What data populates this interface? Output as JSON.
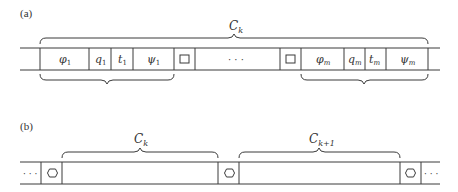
{
  "panel_a": {
    "label": "(a)",
    "top_brace_label": "C",
    "top_brace_sub": "k",
    "first_group": {
      "cells": [
        {
          "sym": "φ",
          "sub": "1"
        },
        {
          "sym": "q",
          "sub": "1"
        },
        {
          "sym": "t",
          "sub": "1"
        },
        {
          "sym": "ψ",
          "sub": "1"
        }
      ]
    },
    "separator_symbol": "□",
    "ellipsis": "· · ·",
    "last_group": {
      "cells": [
        {
          "sym": "φ",
          "sub": "m"
        },
        {
          "sym": "q",
          "sub": "m"
        },
        {
          "sym": "t",
          "sub": "m"
        },
        {
          "sym": "ψ",
          "sub": "m"
        }
      ]
    }
  },
  "panel_b": {
    "label": "(b)",
    "left_ellipsis": "· · ·",
    "right_ellipsis": "· · ·",
    "separator_symbol": "hexagon",
    "blocks": [
      {
        "label": "C",
        "sub": "k"
      },
      {
        "label": "C",
        "sub": "k+1"
      }
    ]
  },
  "colors": {
    "line": "#3a3a3a",
    "text": "#333333",
    "background": "#ffffff"
  }
}
